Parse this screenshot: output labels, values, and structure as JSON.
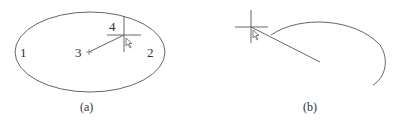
{
  "figure_a": {
    "caption": "(a)",
    "labels": {
      "p1": "1",
      "p2": "2",
      "p3": "3",
      "p4": "4"
    },
    "shape": "ellipse",
    "cursor": "crosshair-with-arrow"
  },
  "figure_b": {
    "caption": "(b)",
    "shape": "arc",
    "cursor": "crosshair-with-arrow"
  },
  "colors": {
    "stroke": "#555555",
    "text": "#333333",
    "background": "#ffffff"
  }
}
